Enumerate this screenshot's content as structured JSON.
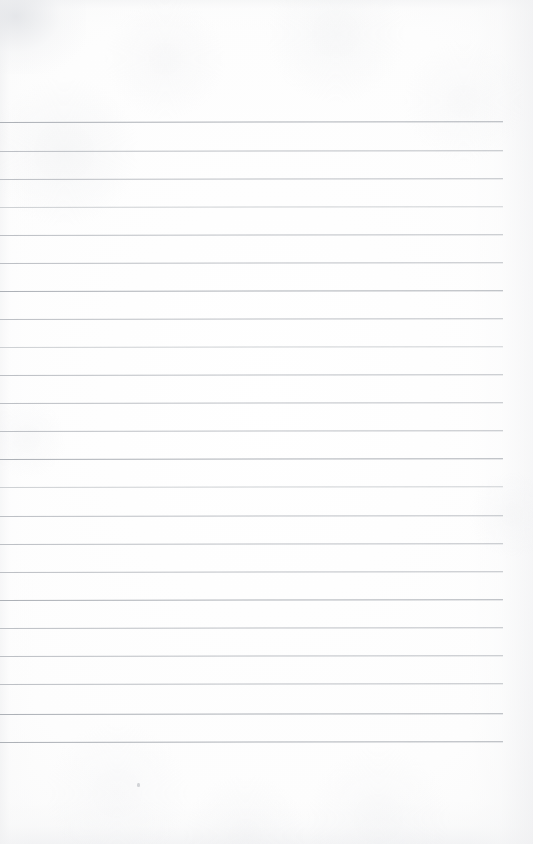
{
  "page": {
    "kind": "scanned-blank-ruled-notebook-page",
    "width_px": 533,
    "height_px": 844,
    "paper_color": "#fdfdfd",
    "edge_shadow_color": "#e9eaec",
    "has_visible_text": false,
    "text_content": "",
    "header_note": ""
  },
  "ruling": {
    "rule_color": "#b7bbc0",
    "rule_color_light": "#c6c9cd",
    "rule_color_dark": "#a9adb3",
    "rule_thickness_px": 1,
    "line_count": 23,
    "first_line_y_px": 122,
    "line_spacing_px": 28.2,
    "line_start_x_px": 0,
    "line_end_x_px": 503,
    "skew_degrees": -0.085,
    "top_margin_px": 122,
    "bottom_margin_px": 101,
    "lines": [
      {
        "index": 1,
        "y": 122,
        "x1": 0,
        "x2": 503,
        "tone": "dark"
      },
      {
        "index": 2,
        "y": 151,
        "x1": 0,
        "x2": 503,
        "tone": "normal"
      },
      {
        "index": 3,
        "y": 179,
        "x1": 0,
        "x2": 503,
        "tone": "normal"
      },
      {
        "index": 4,
        "y": 207,
        "x1": 0,
        "x2": 503,
        "tone": "light"
      },
      {
        "index": 5,
        "y": 235,
        "x1": 0,
        "x2": 503,
        "tone": "normal"
      },
      {
        "index": 6,
        "y": 263,
        "x1": 0,
        "x2": 503,
        "tone": "normal"
      },
      {
        "index": 7,
        "y": 291,
        "x1": 0,
        "x2": 503,
        "tone": "dark"
      },
      {
        "index": 8,
        "y": 319,
        "x1": 0,
        "x2": 503,
        "tone": "normal"
      },
      {
        "index": 9,
        "y": 347,
        "x1": 0,
        "x2": 503,
        "tone": "light"
      },
      {
        "index": 10,
        "y": 375,
        "x1": 0,
        "x2": 503,
        "tone": "normal"
      },
      {
        "index": 11,
        "y": 403,
        "x1": 0,
        "x2": 503,
        "tone": "normal"
      },
      {
        "index": 12,
        "y": 431,
        "x1": 0,
        "x2": 503,
        "tone": "normal"
      },
      {
        "index": 13,
        "y": 459,
        "x1": 0,
        "x2": 503,
        "tone": "dark"
      },
      {
        "index": 14,
        "y": 487,
        "x1": 0,
        "x2": 503,
        "tone": "light"
      },
      {
        "index": 15,
        "y": 516,
        "x1": 0,
        "x2": 503,
        "tone": "normal"
      },
      {
        "index": 16,
        "y": 544,
        "x1": 0,
        "x2": 503,
        "tone": "normal"
      },
      {
        "index": 17,
        "y": 572,
        "x1": 0,
        "x2": 503,
        "tone": "normal"
      },
      {
        "index": 18,
        "y": 600,
        "x1": 0,
        "x2": 503,
        "tone": "dark"
      },
      {
        "index": 19,
        "y": 628,
        "x1": 0,
        "x2": 503,
        "tone": "normal"
      },
      {
        "index": 20,
        "y": 656,
        "x1": 0,
        "x2": 503,
        "tone": "normal"
      },
      {
        "index": 21,
        "y": 684,
        "x1": 0,
        "x2": 503,
        "tone": "normal"
      },
      {
        "index": 22,
        "y": 714,
        "x1": 0,
        "x2": 503,
        "tone": "dark"
      },
      {
        "index": 23,
        "y": 742,
        "x1": 0,
        "x2": 503,
        "tone": "dark"
      }
    ]
  },
  "artifacts": {
    "specks": [
      {
        "x": 137,
        "y": 783,
        "w": 3,
        "h": 4
      }
    ]
  }
}
